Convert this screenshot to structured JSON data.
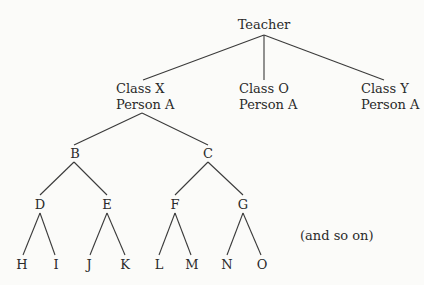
{
  "diagram": {
    "type": "tree",
    "root": {
      "id": "teacher",
      "label": "Teacher"
    },
    "level1": [
      {
        "id": "classX",
        "line1": "Class X",
        "line2": "Person A"
      },
      {
        "id": "classO",
        "line1": "Class O",
        "line2": "Person A"
      },
      {
        "id": "classY",
        "line1": "Class Y",
        "line2": "Person A"
      }
    ],
    "level2": [
      {
        "id": "B",
        "label": "B",
        "parent": "classX"
      },
      {
        "id": "C",
        "label": "C",
        "parent": "classX"
      }
    ],
    "level3": [
      {
        "id": "D",
        "label": "D",
        "parent": "B"
      },
      {
        "id": "E",
        "label": "E",
        "parent": "B"
      },
      {
        "id": "F",
        "label": "F",
        "parent": "C"
      },
      {
        "id": "G",
        "label": "G",
        "parent": "C"
      }
    ],
    "level4": [
      {
        "id": "H",
        "label": "H",
        "parent": "D"
      },
      {
        "id": "I",
        "label": "I",
        "parent": "D"
      },
      {
        "id": "J",
        "label": "J",
        "parent": "E"
      },
      {
        "id": "K",
        "label": "K",
        "parent": "E"
      },
      {
        "id": "L",
        "label": "L",
        "parent": "F"
      },
      {
        "id": "M",
        "label": "M",
        "parent": "F"
      },
      {
        "id": "N",
        "label": "N",
        "parent": "G"
      },
      {
        "id": "O",
        "label": "O",
        "parent": "G"
      }
    ],
    "note": "(and so on)"
  }
}
